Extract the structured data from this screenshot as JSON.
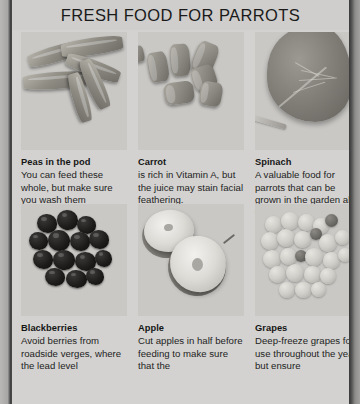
{
  "page": {
    "title": "FRESH FOOD FOR PARROTS",
    "background_color": "#d3d2d0",
    "text_color": "#232323"
  },
  "items": [
    {
      "id": "peas",
      "photo_name": "peas-in-pod-photo",
      "title": "Peas in the pod",
      "body": "You can feed these whole, but make sure you wash them thoroughly."
    },
    {
      "id": "carrot",
      "photo_name": "carrot-photo",
      "title": "Carrot",
      "body": "is rich in Vitamin A, but the juice may stain facial feathering."
    },
    {
      "id": "spinach",
      "photo_name": "spinach-photo",
      "title": "Spinach",
      "body": "A valuable food for parrots that can be grown in the garden all year round."
    },
    {
      "id": "blackberries",
      "photo_name": "blackberries-photo",
      "title": "Blackberries",
      "body": "Avoid berries from roadside verges, where the lead level"
    },
    {
      "id": "apple",
      "photo_name": "apple-photo",
      "title": "Apple",
      "body": "Cut apples in half before feeding to make sure that the"
    },
    {
      "id": "grapes",
      "photo_name": "grapes-photo",
      "title": "Grapes",
      "body": "Deep-freeze grapes for use throughout the year, but ensure"
    }
  ]
}
